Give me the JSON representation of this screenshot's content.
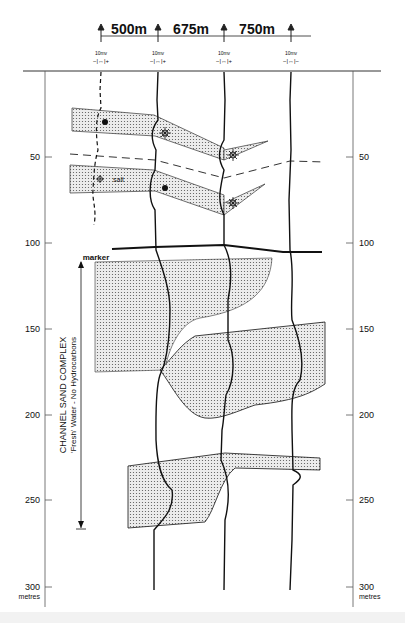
{
  "diagram": {
    "type": "well-log correlation cross-section",
    "spacings": [
      {
        "label": "500m",
        "from_well": 1,
        "to_well": 2
      },
      {
        "label": "675m",
        "from_well": 2,
        "to_well": 3
      },
      {
        "label": "750m",
        "from_well": 3,
        "to_well": 4
      }
    ],
    "wells": [
      {
        "id": 1,
        "scale_label": "10mv",
        "polarity": "−|↔|+"
      },
      {
        "id": 2,
        "scale_label": "10mv",
        "polarity": "−|↔|+"
      },
      {
        "id": 3,
        "scale_label": "10mv",
        "polarity": "−|↔|+"
      },
      {
        "id": 4,
        "scale_label": "10mv",
        "polarity": "−|↔|−"
      }
    ],
    "depth_axis": {
      "ticks": [
        "50",
        "100",
        "150",
        "200",
        "250",
        "300"
      ],
      "unit": "metres"
    },
    "annotations": {
      "marker": "marker",
      "salt": "salt",
      "channel_title": "CHANNEL SAND COMPLEX",
      "channel_subtitle": "'Fresh' Water - No Hydrocarbons"
    },
    "symbols": {
      "oil": "filled-dot",
      "gas": "star-sun",
      "salt": "crossed-circle"
    },
    "colors": {
      "ink": "#111111",
      "sand_fill": "#e4e4e4",
      "background": "#ffffff"
    }
  }
}
